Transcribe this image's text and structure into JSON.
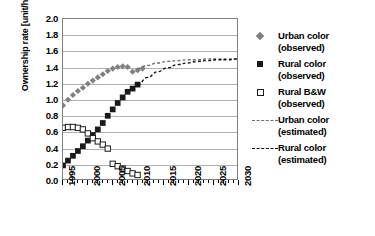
{
  "chart_data": {
    "type": "scatter",
    "title": "",
    "xlabel": "",
    "ylabel": "Ownership rate [unit/household]",
    "xlim": [
      1995,
      2030
    ],
    "ylim": [
      0.0,
      2.0
    ],
    "ytick_step": 0.2,
    "xtick_step": 1,
    "xtick_label_step": 5,
    "grid": "horizontal",
    "legend_position": "right",
    "ytick_labels": [
      "2.0",
      "1.8",
      "1.6",
      "1.4",
      "1.2",
      "1.0",
      "0.8",
      "0.6",
      "0.4",
      "0.2",
      "0.0"
    ],
    "ytick_values": [
      2.0,
      1.8,
      1.6,
      1.4,
      1.2,
      1.0,
      0.8,
      0.6,
      0.4,
      0.2,
      0.0
    ],
    "xtick_labels": [
      "1995",
      "2000",
      "2005",
      "2010",
      "2015",
      "2020",
      "2025",
      "2030"
    ],
    "xtick_values": [
      1995,
      2000,
      2005,
      2010,
      2015,
      2020,
      2025,
      2030
    ],
    "series": [
      {
        "name": "Urban color (observed)",
        "marker": "diamond",
        "color": "#808080",
        "x": [
          1995,
          1996,
          1997,
          1998,
          1999,
          2000,
          2001,
          2002,
          2003,
          2004,
          2005,
          2006,
          2007,
          2008,
          2009,
          2010,
          2011
        ],
        "values": [
          0.92,
          0.99,
          1.05,
          1.1,
          1.14,
          1.19,
          1.23,
          1.27,
          1.31,
          1.35,
          1.38,
          1.4,
          1.41,
          1.4,
          1.34,
          1.36,
          1.38
        ]
      },
      {
        "name": "Rural color (observed)",
        "marker": "square-filled",
        "color": "#1a1a1a",
        "x": [
          1995,
          1996,
          1997,
          1998,
          1999,
          2000,
          2001,
          2002,
          2003,
          2004,
          2005,
          2006,
          2007,
          2008,
          2009,
          2010
        ],
        "values": [
          0.17,
          0.23,
          0.29,
          0.35,
          0.41,
          0.48,
          0.55,
          0.62,
          0.7,
          0.79,
          0.87,
          0.95,
          1.02,
          1.09,
          1.13,
          1.18
        ]
      },
      {
        "name": "Rural B&W (observed)",
        "marker": "square-open",
        "color": "#1a1a1a",
        "x": [
          1995,
          1996,
          1997,
          1998,
          1999,
          2000,
          2001,
          2002,
          2003,
          2004,
          2005,
          2006,
          2007,
          2008,
          2009,
          2010
        ],
        "values": [
          0.64,
          0.65,
          0.65,
          0.64,
          0.62,
          0.57,
          0.51,
          0.47,
          0.43,
          0.38,
          0.19,
          0.16,
          0.13,
          0.1,
          0.07,
          0.05
        ]
      },
      {
        "name": "Urban color (estimated)",
        "marker": "dashed-line",
        "color": "#6e6e6e",
        "x": [
          2010,
          2012,
          2014,
          2016,
          2018,
          2020,
          2022,
          2024,
          2026,
          2028,
          2030
        ],
        "values": [
          1.38,
          1.42,
          1.45,
          1.47,
          1.48,
          1.49,
          1.49,
          1.5,
          1.5,
          1.5,
          1.5
        ]
      },
      {
        "name": "Rural color (estimated)",
        "marker": "dashed-line",
        "color": "#111111",
        "x": [
          2010,
          2012,
          2014,
          2016,
          2018,
          2020,
          2022,
          2024,
          2026,
          2028,
          2030
        ],
        "values": [
          1.18,
          1.27,
          1.34,
          1.39,
          1.43,
          1.45,
          1.47,
          1.48,
          1.49,
          1.49,
          1.5
        ]
      }
    ],
    "legend": [
      {
        "label_line1": "Urban color",
        "label_line2": "(observed)",
        "key": "diamond-gray"
      },
      {
        "label_line1": "Rural color",
        "label_line2": "(observed)",
        "key": "square-filled-black"
      },
      {
        "label_line1": "Rural B&W",
        "label_line2": "(observed)",
        "key": "square-open-black"
      },
      {
        "label_line1": "Urban color",
        "label_line2": "(estimated)",
        "key": "dashed-line-gray"
      },
      {
        "label_line1": "Rural color",
        "label_line2": "(estimated)",
        "key": "dashed-line-black"
      }
    ]
  },
  "colors": {
    "urban_observed": "#808080",
    "rural_observed": "#1a1a1a",
    "rural_bw_observed": "#1a1a1a",
    "urban_estimated": "#6e6e6e",
    "rural_estimated": "#111111",
    "grid": "#b0b0b0",
    "axis": "#808080",
    "background": "#ffffff"
  }
}
